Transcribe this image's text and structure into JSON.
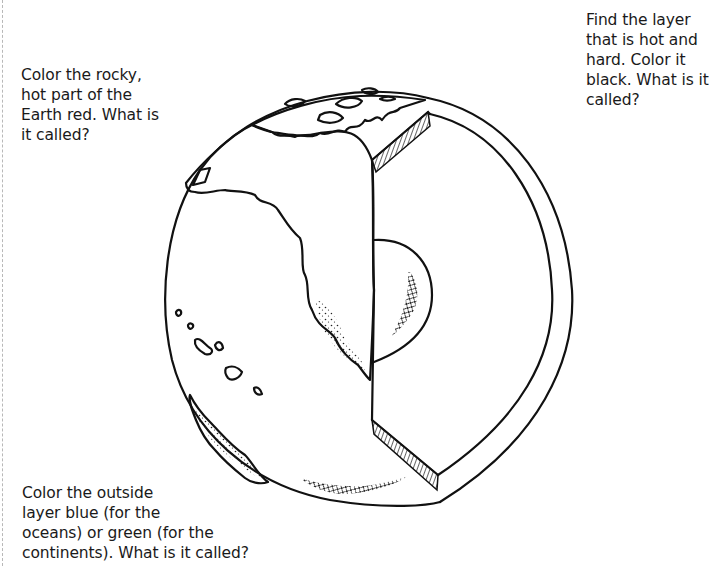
{
  "worksheet": {
    "topic": "Layers of the Earth",
    "prompts": {
      "mantle": {
        "lines": [
          "Color the rocky,",
          "hot part of the",
          "Earth red. What is",
          "it called?"
        ],
        "color_instruction": "red"
      },
      "hard_layer": {
        "lines": [
          "Find the layer",
          "that is hot and",
          "hard. Color it",
          "black. What is it",
          "called?"
        ],
        "color_instruction": "black"
      },
      "outside_layer": {
        "lines": [
          "Color the outside",
          "layer blue (for the",
          "oceans) or green (for the",
          "continents). What is it called?"
        ],
        "color_instruction": "blue / green"
      }
    },
    "illustration": {
      "subject": "globe-cutaway-icon",
      "parts": [
        "outer-shell",
        "cutaway-rim",
        "hatched-crust-section",
        "inner-core-sphere",
        "continents",
        "islands"
      ]
    },
    "colors": {
      "ink": "#111111",
      "paper": "#ffffff",
      "margin_rule": "#b8b8b8"
    }
  }
}
